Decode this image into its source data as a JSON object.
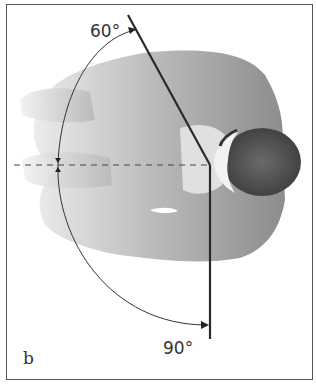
{
  "figure": {
    "panel_label": "b",
    "angles": {
      "start_label": "60°",
      "end_label": "90°"
    },
    "colors": {
      "line": "#2a2a2a",
      "body_light": "#d8d8d8",
      "body_dark": "#8a8a8a",
      "head": "#555555",
      "border": "#555555"
    }
  }
}
